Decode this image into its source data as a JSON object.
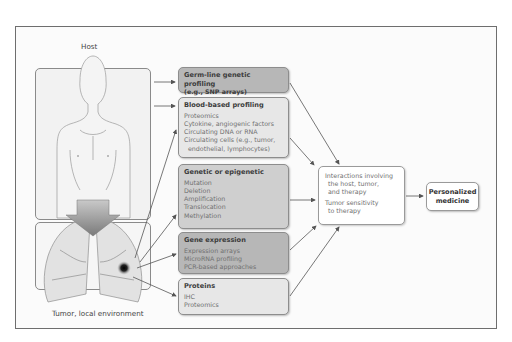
{
  "diagram": {
    "host_label": "Host",
    "tumor_label": "Tumor, local environment",
    "profiling_boxes": [
      {
        "title": "Germ-line genetic profiling",
        "items": [
          "(e.g., SNP arrays)"
        ],
        "shade": "dark"
      },
      {
        "title": "Blood-based profiling",
        "items": [
          "Proteomics",
          "Cytokine, angiogenic factors",
          "Circulating DNA or RNA",
          "Circulating cells (e.g., tumor,",
          "  endothelial, lymphocytes)"
        ],
        "shade": "light"
      },
      {
        "title": "Genetic or epigenetic",
        "items": [
          "Mutation",
          "Deletion",
          "Amplification",
          "Translocation",
          "Methylation"
        ],
        "shade": "mid"
      },
      {
        "title": "Gene expression",
        "items": [
          "Expression arrays",
          "MicroRNA profiling",
          "PCR-based approaches"
        ],
        "shade": "dark"
      },
      {
        "title": "Proteins",
        "items": [
          "IHC",
          "Proteomics"
        ],
        "shade": "light"
      }
    ],
    "interactions_box": {
      "lines": [
        "Interactions involving",
        "the host, tumor,",
        "and therapy"
      ],
      "lines2": [
        "Tumor sensitivity",
        "to therapy"
      ]
    },
    "outcome_box": {
      "lines": [
        "Personalized",
        "medicine"
      ]
    },
    "colors": {
      "frame_border": "#6e6e6e",
      "box_dark": "#b7b7b7",
      "box_mid": "#cfcfcf",
      "box_light": "#e7e7e7",
      "arrow": "#555555"
    }
  }
}
